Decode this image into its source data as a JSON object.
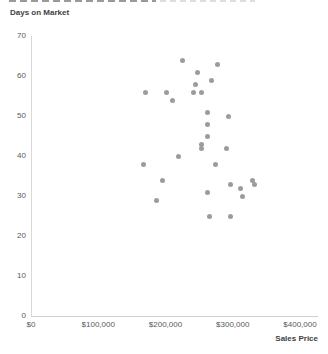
{
  "chart_data": {
    "type": "scatter",
    "title": "",
    "xlabel": "Sales Price",
    "ylabel": "Days on Market",
    "xlim": [
      0,
      400000
    ],
    "ylim": [
      0,
      70
    ],
    "grid": false,
    "legend": null,
    "colors": {
      "marker": "#9C9C9C",
      "y_axis_line": "#D9D9D9",
      "x_axis_line": "#CFCFCF",
      "tick_label": "#595959",
      "axis_title": "#3F3F3F"
    },
    "x_ticks": [
      {
        "value": 0,
        "label": "$0"
      },
      {
        "value": 100000,
        "label": "$100,000"
      },
      {
        "value": 200000,
        "label": "$200,000"
      },
      {
        "value": 300000,
        "label": "$300,000"
      },
      {
        "value": 400000,
        "label": "$400,000"
      }
    ],
    "y_ticks": [
      {
        "value": 0,
        "label": "0"
      },
      {
        "value": 10,
        "label": "10"
      },
      {
        "value": 20,
        "label": "20"
      },
      {
        "value": 30,
        "label": "30"
      },
      {
        "value": 40,
        "label": "40"
      },
      {
        "value": 50,
        "label": "50"
      },
      {
        "value": 60,
        "label": "60"
      },
      {
        "value": 70,
        "label": "70"
      }
    ],
    "points": [
      {
        "x": 226000,
        "y": 64
      },
      {
        "x": 278000,
        "y": 63
      },
      {
        "x": 247000,
        "y": 61
      },
      {
        "x": 269000,
        "y": 59
      },
      {
        "x": 244000,
        "y": 58
      },
      {
        "x": 170000,
        "y": 56
      },
      {
        "x": 201000,
        "y": 56
      },
      {
        "x": 242000,
        "y": 56
      },
      {
        "x": 254000,
        "y": 56
      },
      {
        "x": 211000,
        "y": 54
      },
      {
        "x": 263000,
        "y": 51
      },
      {
        "x": 294000,
        "y": 50
      },
      {
        "x": 262000,
        "y": 48
      },
      {
        "x": 262000,
        "y": 45
      },
      {
        "x": 254000,
        "y": 43
      },
      {
        "x": 253000,
        "y": 42
      },
      {
        "x": 291000,
        "y": 42
      },
      {
        "x": 219000,
        "y": 40
      },
      {
        "x": 167000,
        "y": 38
      },
      {
        "x": 275000,
        "y": 38
      },
      {
        "x": 195000,
        "y": 34
      },
      {
        "x": 330000,
        "y": 34
      },
      {
        "x": 297000,
        "y": 33
      },
      {
        "x": 332000,
        "y": 33
      },
      {
        "x": 311000,
        "y": 32
      },
      {
        "x": 263000,
        "y": 31
      },
      {
        "x": 314000,
        "y": 30
      },
      {
        "x": 186000,
        "y": 29
      },
      {
        "x": 266000,
        "y": 25
      },
      {
        "x": 296000,
        "y": 25
      }
    ]
  }
}
